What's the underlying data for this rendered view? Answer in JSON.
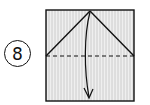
{
  "step": {
    "number": "8"
  },
  "diagram": {
    "type": "origami-fold-instruction",
    "paper": {
      "x": 46,
      "y": 10,
      "width": 88,
      "height": 91,
      "fill": "#e6e6e6",
      "stroke": "#111111"
    },
    "creases": [
      {
        "kind": "diagonal",
        "from": [
          46,
          56
        ],
        "to": [
          90,
          11
        ]
      },
      {
        "kind": "diagonal",
        "from": [
          90,
          11
        ],
        "to": [
          134,
          56
        ]
      }
    ],
    "valley_fold_line": {
      "kind": "dashed",
      "from": [
        46,
        56
      ],
      "to": [
        134,
        56
      ]
    },
    "fold_arrow": {
      "from": [
        90,
        11
      ],
      "to": [
        88,
        98
      ],
      "direction": "down"
    },
    "colors": {
      "line": "#111111",
      "paper": "#e6e6e6",
      "hatch": "#c8c8c8"
    }
  }
}
